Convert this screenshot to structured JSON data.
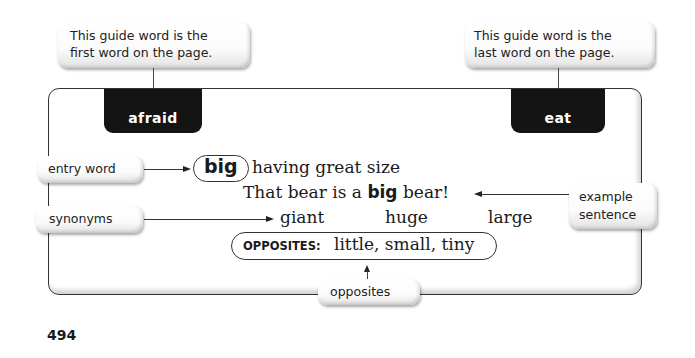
{
  "callouts": {
    "first_guide": {
      "line1": "This guide word is the",
      "line2": "first word on the page."
    },
    "last_guide": {
      "line1": "This guide word is the",
      "line2": "last word on the page."
    },
    "entry_word": "entry word",
    "synonyms": "synonyms",
    "example_sentence": {
      "line1": "example",
      "line2": "sentence"
    },
    "opposites": "opposites"
  },
  "guide_words": {
    "first": "afraid",
    "last": "eat"
  },
  "entry": {
    "word": "big",
    "definition": "having great size",
    "example": {
      "before": "That bear is a ",
      "highlight": "big",
      "after": " bear!"
    },
    "synonyms": [
      "giant",
      "huge",
      "large"
    ],
    "opposites_label": "OPPOSITES:",
    "opposites": "little, small, tiny"
  },
  "page_number": "494"
}
